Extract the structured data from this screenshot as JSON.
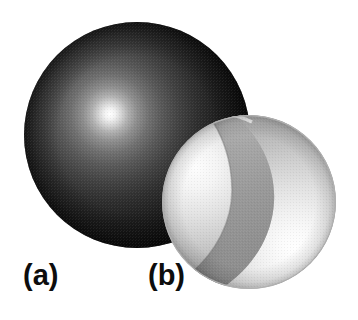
{
  "figure": {
    "background_color": "#ffffff",
    "width": 358,
    "height": 320,
    "caption_labels": [
      {
        "id": "a",
        "text": "(a)",
        "x": 23,
        "y": 261
      },
      {
        "id": "b",
        "text": "(b)",
        "x": 148,
        "y": 261
      }
    ]
  },
  "objects": {
    "sphere_a": {
      "name": "dark-solid-sphere",
      "label": "(a)",
      "center_x": 137,
      "center_y": 135,
      "radius": 113,
      "highlight_x": 110,
      "highlight_y": 114,
      "highlight_color": "#ffffff",
      "mid_color": "#6b6b6b",
      "edge_color": "#111111",
      "rim_color": "#0a0a0a"
    },
    "sphere_b": {
      "name": "cutaway-hollow-sphere",
      "label": "(b)",
      "center_x": 249,
      "center_y": 202,
      "radius": 87,
      "outer_shell_color": "#e8e8e8",
      "outer_shell_shadow": "#9d9d9d",
      "cut_face_color": "#9b9b9b",
      "cut_face_dark": "#8a8a8a",
      "inner_bowl_color": "#fbfbfb",
      "inner_bowl_shadow": "#c2c2c2",
      "inner_highlight_x": 295,
      "inner_highlight_y": 248,
      "rim_color": "#b4b4b4"
    }
  },
  "colors": {
    "background": "#ffffff",
    "label_text": "#0d0d0d",
    "dark_sphere_core": "#111111",
    "light_sphere_base": "#e0e0e0"
  }
}
